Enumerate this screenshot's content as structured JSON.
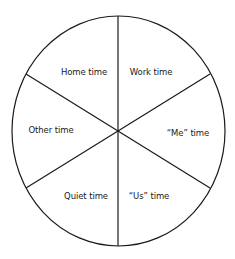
{
  "diagram": {
    "type": "segmented-circle",
    "segments": [
      {
        "label": "Home time"
      },
      {
        "label": "Work time"
      },
      {
        "label": "Other time"
      },
      {
        "label": "“Me” time"
      },
      {
        "label": "Quiet time"
      },
      {
        "label": "“Us” time"
      }
    ],
    "line_color": "#1a1a1a",
    "background": "#ffffff"
  }
}
